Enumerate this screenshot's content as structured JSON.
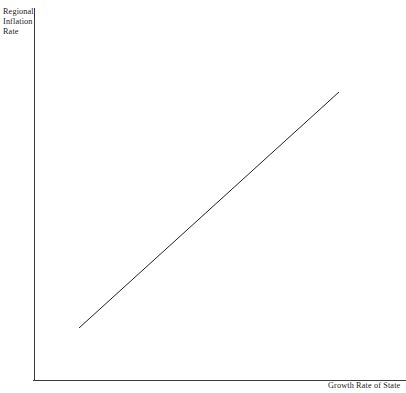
{
  "figure": {
    "background_color": "#ffffff",
    "width": 406,
    "height": 393
  },
  "labels": {
    "y_axis": "Regional\nInflation\nRate",
    "x_axis": "Growth Rate of State"
  },
  "chart_data": {
    "type": "line",
    "title": "",
    "xlabel": "Growth Rate of State",
    "ylabel": "Regional Inflation Rate",
    "grid": false,
    "legend": false,
    "tick_labels": {
      "x": [],
      "y": []
    },
    "xlim": [
      0,
      1
    ],
    "ylim": [
      0,
      1
    ],
    "annotations": [],
    "series": [
      {
        "name": "Regional inflation vs state growth",
        "relationship": "positive linear",
        "color": "#222222",
        "line_width": 1,
        "x": [
          0.132,
          0.881
        ],
        "y": [
          0.14,
          0.774
        ],
        "pixel_points": [
          {
            "x": 79,
            "y": 328
          },
          {
            "x": 339,
            "y": 92
          }
        ]
      }
    ],
    "axes": {
      "color": "#3a3a3a",
      "line_width": 1,
      "y_axis_pixels": {
        "x": 34,
        "y_top": 8,
        "y_bottom": 380
      },
      "x_axis_pixels": {
        "y": 380,
        "x_left": 33,
        "x_right": 406
      }
    }
  }
}
